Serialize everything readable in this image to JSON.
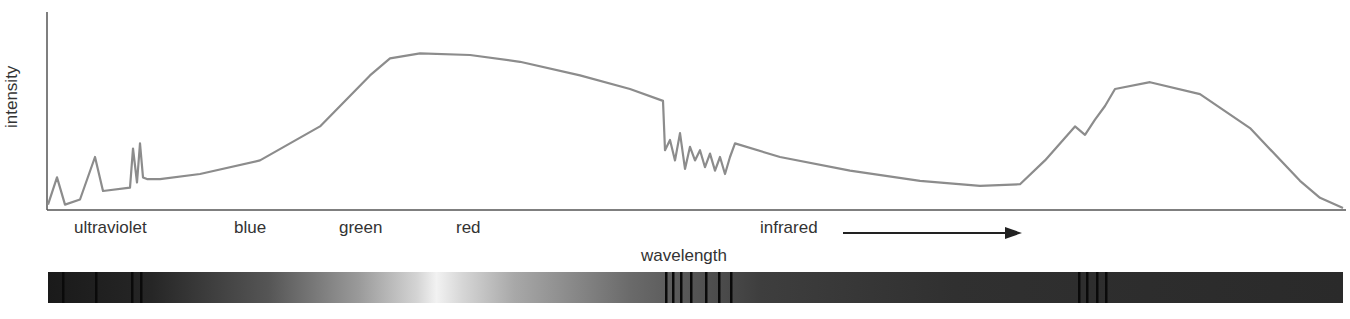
{
  "chart_data": {
    "type": "line",
    "title": "",
    "xlabel": "wavelength",
    "ylabel": "intensity",
    "grid": false,
    "legend": null,
    "region_labels": [
      "ultraviolet",
      "blue",
      "green",
      "red",
      "infrared"
    ],
    "annotations": [
      "infrared →"
    ],
    "x": [
      48,
      57,
      65,
      80,
      95,
      103,
      130,
      133,
      137,
      140,
      143,
      147,
      160,
      200,
      260,
      320,
      370,
      390,
      420,
      470,
      520,
      580,
      630,
      663,
      665,
      670,
      675,
      680,
      685,
      690,
      695,
      700,
      705,
      710,
      715,
      720,
      725,
      730,
      735,
      780,
      850,
      920,
      980,
      1020,
      1045,
      1075,
      1085,
      1095,
      1105,
      1115,
      1150,
      1200,
      1250,
      1300,
      1320,
      1343
    ],
    "y": [
      2,
      18,
      2,
      5,
      30,
      10,
      12,
      35,
      15,
      38,
      18,
      17,
      17,
      20,
      28,
      48,
      78,
      88,
      91,
      90,
      86,
      78,
      70,
      63,
      34,
      40,
      28,
      44,
      23,
      36,
      28,
      34,
      24,
      32,
      22,
      30,
      20,
      30,
      38,
      30,
      22,
      16,
      13,
      14,
      28,
      48,
      43,
      52,
      60,
      70,
      74,
      67,
      47,
      16,
      6,
      0
    ],
    "ylim": [
      0,
      100
    ],
    "spectrum_bar": {
      "dark_lines_px": [
        62,
        95,
        131,
        140,
        665,
        672,
        680,
        690,
        705,
        718,
        730,
        1078,
        1086,
        1096,
        1105
      ],
      "brightest_at_px": 420
    }
  },
  "labels": {
    "y_axis": "intensity",
    "x_axis": "wavelength",
    "ultraviolet": "ultraviolet",
    "blue": "blue",
    "green": "green",
    "red": "red",
    "infrared": "infrared"
  },
  "colors": {
    "curve": "#8c8c8c",
    "axis": "#555555",
    "text": "#333333",
    "arrow": "#222222"
  }
}
